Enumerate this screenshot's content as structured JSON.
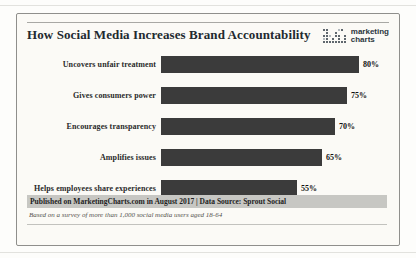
{
  "logo": {
    "line1": "marketing",
    "line2": "charts",
    "icon": "dots-grid-logo-icon"
  },
  "chart_data": {
    "type": "bar",
    "orientation": "horizontal",
    "title": "How Social Media Increases Brand Accountability",
    "categories": [
      "Uncovers unfair treatment",
      "Gives consumers power",
      "Encourages transparency",
      "Amplifies issues",
      "Helps employees share experiences"
    ],
    "values": [
      80,
      75,
      70,
      65,
      55
    ],
    "value_labels": [
      "80%",
      "75%",
      "70%",
      "65%",
      "55%"
    ],
    "xlabel": "",
    "ylabel": "",
    "xlim": [
      0,
      100
    ],
    "grid": false,
    "legend": "none",
    "bar_color": "#3b3b3b",
    "background_color": "#fbfaf6"
  },
  "footer": {
    "published": "Published on MarketingCharts.com in August 2017 | Data Source: Sprout Social",
    "note": "Based on a survey of more than 1,000 social media users aged 18-64"
  },
  "colors": {
    "bar": "#3b3b3b",
    "card_background": "#fbfaf6",
    "card_border": "#8f8f8c",
    "published_strip": "#c7c7c3",
    "logo_navy": "#2b3640",
    "title_text": "#222a30"
  }
}
